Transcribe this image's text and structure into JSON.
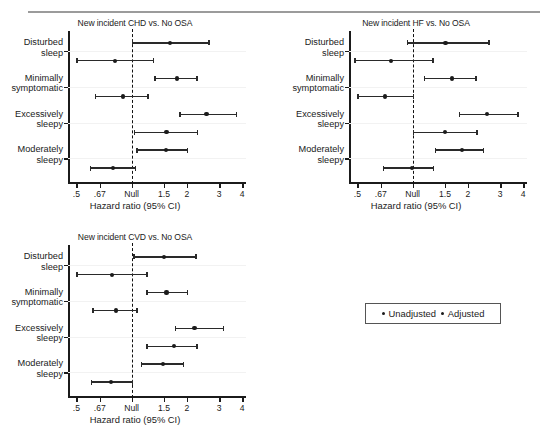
{
  "figure": {
    "xaxis_title": "Hazard ratio (95% CI)",
    "tick_labels": [
      ".5",
      ".67",
      "Null",
      "1.5",
      "2",
      "3",
      "4"
    ],
    "tick_values": [
      0.5,
      0.67,
      1.0,
      1.5,
      2.0,
      3.0,
      4.0
    ],
    "null_label": "Null",
    "categories": [
      "Disturbed sleep",
      "Minimally symptomatic",
      "Excessively sleepy",
      "Moderately sleepy"
    ],
    "category_lines": [
      [
        "Disturbed",
        "sleep"
      ],
      [
        "Minimally",
        "symptomatic"
      ],
      [
        "Excessively",
        "sleepy"
      ],
      [
        "Moderately",
        "sleepy"
      ]
    ],
    "series_names": [
      "Unadjusted",
      "Adjusted"
    ]
  },
  "legend": {
    "unadjusted": "Unadjusted",
    "adjusted": "Adjusted"
  },
  "panels": [
    {
      "id": "chd",
      "title": "New incident CHD vs. No OSA",
      "xtitle": "Hazard ratio (95% CI)"
    },
    {
      "id": "hf",
      "title": "New incident HF vs. No OSA",
      "xtitle": "Hazard ratio (95% CI)"
    },
    {
      "id": "cvd",
      "title": "New incident CVD vs. No OSA",
      "xtitle": "Hazard ratio (95% CI)"
    }
  ],
  "chart_data": [
    {
      "type": "scatter",
      "id": "chd",
      "title": "New incident CHD vs. No OSA",
      "xlabel": "Hazard ratio (95% CI)",
      "ylabel": "",
      "xscale": "log",
      "xlim": [
        0.45,
        4.2
      ],
      "xticks": [
        0.5,
        0.67,
        1.0,
        1.5,
        2.0,
        3.0,
        4.0
      ],
      "xticklabels": [
        ".5",
        ".67",
        "Null",
        "1.5",
        "2",
        "3",
        "4"
      ],
      "reference_line": 1.0,
      "grid": false,
      "legend": [
        "Unadjusted",
        "Adjusted"
      ],
      "categories": [
        "Disturbed sleep",
        "Minimally symptomatic",
        "Excessively sleepy",
        "Moderately sleepy"
      ],
      "series": [
        {
          "name": "Unadjusted",
          "estimates": [
            1.62,
            1.77,
            2.56,
            1.54
          ],
          "ci_low": [
            1.0,
            1.33,
            1.82,
            1.06
          ],
          "ci_high": [
            2.62,
            2.25,
            3.7,
            2.0
          ]
        },
        {
          "name": "Adjusted",
          "estimates": [
            0.81,
            0.9,
            1.55,
            0.79
          ],
          "ci_low": [
            0.5,
            0.63,
            1.03,
            0.59
          ],
          "ci_high": [
            1.3,
            1.22,
            2.26,
            1.04
          ]
        }
      ]
    },
    {
      "type": "scatter",
      "id": "hf",
      "title": "New incident HF vs. No OSA",
      "xlabel": "Hazard ratio (95% CI)",
      "ylabel": "",
      "xscale": "log",
      "xlim": [
        0.45,
        4.2
      ],
      "xticks": [
        0.5,
        0.67,
        1.0,
        1.5,
        2.0,
        3.0,
        4.0
      ],
      "xticklabels": [
        ".5",
        ".67",
        "Null",
        "1.5",
        "2",
        "3",
        "4"
      ],
      "reference_line": 1.0,
      "grid": false,
      "legend": [
        "Unadjusted",
        "Adjusted"
      ],
      "categories": [
        "Disturbed sleep",
        "Minimally symptomatic",
        "Excessively sleepy",
        "Moderately sleepy"
      ],
      "series": [
        {
          "name": "Unadjusted",
          "estimates": [
            1.51,
            1.64,
            2.55,
            1.86
          ],
          "ci_low": [
            0.93,
            1.15,
            1.78,
            1.32
          ],
          "ci_high": [
            2.58,
            2.2,
            3.72,
            2.42
          ]
        },
        {
          "name": "Adjusted",
          "estimates": [
            0.76,
            0.71,
            1.5,
            0.99
          ],
          "ci_low": [
            0.48,
            0.5,
            1.0,
            0.69
          ],
          "ci_high": [
            1.28,
            1.0,
            2.22,
            1.29
          ]
        }
      ]
    },
    {
      "type": "scatter",
      "id": "cvd",
      "title": "New incident CVD vs. No OSA",
      "xlabel": "Hazard ratio (95% CI)",
      "ylabel": "",
      "xscale": "log",
      "xlim": [
        0.45,
        4.2
      ],
      "xticks": [
        0.5,
        0.67,
        1.0,
        1.5,
        2.0,
        3.0,
        4.0
      ],
      "xticklabels": [
        ".5",
        ".67",
        "Null",
        "1.5",
        "2",
        "3",
        "4"
      ],
      "reference_line": 1.0,
      "grid": false,
      "legend": [
        "Unadjusted",
        "Adjusted"
      ],
      "categories": [
        "Disturbed sleep",
        "Minimally symptomatic",
        "Excessively sleepy",
        "Moderately sleepy"
      ],
      "series": [
        {
          "name": "Unadjusted",
          "estimates": [
            1.5,
            1.55,
            2.2,
            1.48
          ],
          "ci_low": [
            1.02,
            1.2,
            1.72,
            1.12
          ],
          "ci_high": [
            2.22,
            2.0,
            3.15,
            1.9
          ]
        },
        {
          "name": "Adjusted",
          "estimates": [
            0.78,
            0.82,
            1.7,
            0.77
          ],
          "ci_low": [
            0.5,
            0.61,
            1.2,
            0.6
          ],
          "ci_high": [
            1.2,
            1.06,
            2.25,
            1.0
          ]
        }
      ]
    }
  ]
}
